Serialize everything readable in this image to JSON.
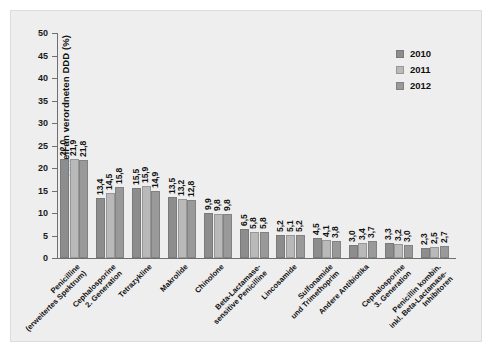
{
  "chart_data": {
    "type": "bar",
    "title": "",
    "subtitle": "",
    "xlabel": "",
    "ylabel": "Anteil an verordneten DDD (%)",
    "ylim": [
      0,
      50
    ],
    "ytick_values": [
      0,
      5,
      10,
      15,
      20,
      25,
      30,
      35,
      40,
      45,
      50
    ],
    "ytick_labels": [
      "0",
      "5",
      "10",
      "15",
      "20",
      "25",
      "30",
      "35",
      "40",
      "45",
      "50"
    ],
    "grid": false,
    "legend_position": "upper right",
    "decimal_separator": ",",
    "categories": [
      "Penicilline\n(erweitertes Spektrum)",
      "Cephalosporine\n2. Generation",
      "Tetrazykline",
      "Makrolide",
      "Chinolone",
      "Beta-Lactamase-\nsensitive Penicilline",
      "Lincosamide",
      "Sulfonamide\nund Trimethoprim",
      "Andere Antibiotika",
      "Cephalosporine\n3. Generation",
      "Penicillin kombin.\ninkl. Beta-Lactamase-\nInhibitoren"
    ],
    "series": [
      {
        "name": "2010",
        "color": "#8d8d8d",
        "values": [
          22.0,
          13.4,
          15.5,
          13.5,
          9.9,
          6.5,
          5.2,
          4.5,
          3.0,
          3.3,
          2.3
        ],
        "labels": [
          "22,0",
          "13,4",
          "15,5",
          "13,5",
          "9,9",
          "6,5",
          "5,2",
          "4,5",
          "3,0",
          "3,3",
          "2,3"
        ]
      },
      {
        "name": "2011",
        "color": "#b9b9b9",
        "values": [
          21.9,
          14.5,
          15.9,
          13.2,
          9.8,
          5.8,
          5.1,
          4.1,
          3.4,
          3.2,
          2.5
        ],
        "labels": [
          "21,9",
          "14,5",
          "15,9",
          "13,2",
          "9,8",
          "5,8",
          "5,1",
          "4,1",
          "3,4",
          "3,2",
          "2,5"
        ]
      },
      {
        "name": "2012",
        "color": "#999999",
        "values": [
          21.8,
          15.8,
          14.9,
          12.8,
          9.8,
          5.8,
          5.2,
          3.8,
          3.7,
          3.0,
          2.7
        ],
        "labels": [
          "21,8",
          "15,8",
          "14,9",
          "12,8",
          "9,8",
          "5,8",
          "5,2",
          "3,8",
          "3,7",
          "3,0",
          "2,7"
        ]
      }
    ]
  }
}
